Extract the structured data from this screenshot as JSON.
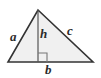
{
  "figure": {
    "type": "geometry-diagram",
    "shape": "triangle-with-altitude",
    "background_color": "#ffffff",
    "fill_color": "#f0f0f0",
    "stroke_color": "#333333",
    "label_color": "#2b2b2b",
    "vertices": {
      "apex": {
        "x": 38,
        "y": 10
      },
      "bottom_left": {
        "x": 8,
        "y": 62
      },
      "bottom_right": {
        "x": 93,
        "y": 62
      }
    },
    "altitude": {
      "from": {
        "x": 38,
        "y": 10
      },
      "to": {
        "x": 38,
        "y": 62
      }
    },
    "right_angle_marker": {
      "x": 38,
      "y": 53,
      "size": 9,
      "side": "right-of-altitude"
    },
    "labels": {
      "side_a": "a",
      "side_c": "c",
      "base_b": "b",
      "height_h": "h"
    }
  }
}
